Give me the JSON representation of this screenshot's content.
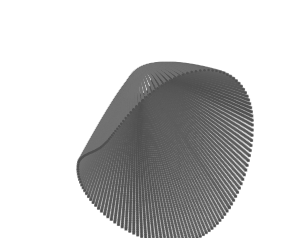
{
  "figure": {
    "kind": "3d-dotted-parametric-surface",
    "title": "",
    "caption": "",
    "background_color": "#ffffff",
    "width": 282,
    "height": 238
  },
  "chart_data": {
    "type": "scatter",
    "title": "",
    "subtitle": "",
    "xlabel": "",
    "ylabel": "",
    "zlabel": "",
    "render_style": "point-mesh",
    "shading": "grayscale-diffuse",
    "grid": false,
    "legend": false,
    "axes_visible": false,
    "tick_labels": [],
    "annotations": [],
    "colors": {
      "background": "#ffffff",
      "dot_dark": "#4a4a4a",
      "dot_mid": "#7d7d7d",
      "surface_light": "#e8e8e8",
      "surface_mid": "#a8a8a8",
      "surface_dark": "#6e6e6e",
      "silhouette": "#585858"
    },
    "shape": {
      "name": "cuspidal-horn-surface",
      "description": "Self-intersecting horn/cone surface with a pointed wing at upper-left, a flared open rim at upper-right, and a rounded lobe at the bottom",
      "u_range": [
        0,
        6.283185307179586
      ],
      "v_range": [
        0,
        1
      ],
      "u_steps": 150,
      "v_steps": 72,
      "dot_radius_px": 1.25,
      "dot_spacing_px": 3
    },
    "camera": {
      "azimuth_deg": -38,
      "elevation_deg": 22,
      "roll_deg": 6,
      "scale": 1.0,
      "center_x": 141,
      "center_y": 119
    },
    "light": {
      "direction": [
        0.45,
        -0.72,
        0.53
      ],
      "ambient": 0.34,
      "diffuse": 0.66
    },
    "silhouette_extents": {
      "wing_tip": [
        11,
        19
      ],
      "top_rim_peak": [
        221,
        12
      ],
      "right_edge": [
        272,
        66
      ],
      "bottom_lobe": [
        134,
        229
      ],
      "left_edge": [
        27,
        92
      ]
    },
    "values": [],
    "x": [],
    "y": []
  }
}
